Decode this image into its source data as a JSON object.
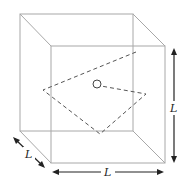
{
  "diagram": {
    "colors": {
      "edge": "#a8a8a8",
      "path": "#555555",
      "arrow": "#222222",
      "background": "#ffffff"
    },
    "cube": {
      "back_face": {
        "x1": 20,
        "y1": 14,
        "x2": 133,
        "y2": 131
      },
      "front_face": {
        "x1": 51,
        "y1": 46,
        "x2": 165,
        "y2": 163
      }
    },
    "trajectory": {
      "style": "dashed",
      "points": [
        [
          136,
          52
        ],
        [
          43,
          90
        ],
        [
          100,
          134
        ],
        [
          146,
          94
        ],
        [
          101,
          86
        ]
      ]
    },
    "particle": {
      "cx": 97,
      "cy": 84,
      "r": 4
    },
    "dimensions": [
      {
        "id": "depth",
        "label": "L",
        "from": [
          13,
          137
        ],
        "to": [
          45,
          168
        ],
        "label_pos": [
          29,
          156
        ]
      },
      {
        "id": "width",
        "label": "L",
        "from": [
          52,
          172
        ],
        "to": [
          164,
          172
        ],
        "label_pos": [
          108,
          176
        ]
      },
      {
        "id": "height",
        "label": "L",
        "from": [
          174,
          48
        ],
        "to": [
          174,
          163
        ],
        "label_pos": [
          174,
          110
        ]
      }
    ]
  }
}
